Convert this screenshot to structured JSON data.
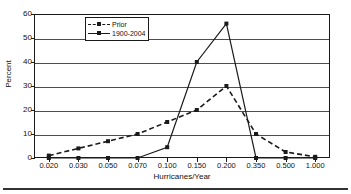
{
  "chart_data": {
    "type": "line",
    "title": "",
    "xlabel": "Hurricanes/Year",
    "ylabel": "Percent",
    "categories": [
      "0.020",
      "0.030",
      "0.050",
      "0.070",
      "0.100",
      "0.150",
      "0.200",
      "0.350",
      "0.500",
      "1.000"
    ],
    "ylim": [
      0,
      60
    ],
    "yticks": [
      "0",
      "10",
      "20",
      "30",
      "40",
      "50",
      "60"
    ],
    "ytick_values": [
      0,
      10,
      20,
      30,
      40,
      50,
      60
    ],
    "grid": "horizontal",
    "legend_position": "top-left-inside",
    "series": [
      {
        "name": "Prior",
        "style": "dashed",
        "marker": "square",
        "color": "#1a1a1a",
        "values": [
          1,
          4,
          7,
          10,
          15,
          20,
          30,
          10,
          2.5,
          0.5
        ]
      },
      {
        "name": "1900-2004",
        "style": "solid",
        "marker": "square",
        "color": "#1a1a1a",
        "values": [
          0,
          0,
          0,
          0,
          4.5,
          40,
          56,
          0,
          0,
          0
        ]
      }
    ]
  },
  "legend": {
    "entries": [
      {
        "label": "Prior"
      },
      {
        "label": "1900-2004"
      }
    ]
  },
  "axes": {
    "y_title": "Percent",
    "x_title": "Hurricanes/Year"
  }
}
